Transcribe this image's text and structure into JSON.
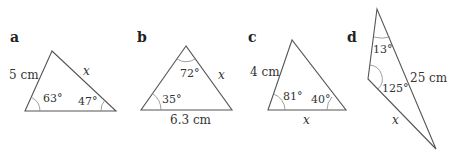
{
  "figure": {
    "panels": [
      {
        "id": "a",
        "side_labels": {
          "left": "5 cm",
          "right": "x"
        },
        "angles": {
          "bottom_left": "63°",
          "bottom_right": "47°"
        }
      },
      {
        "id": "b",
        "side_labels": {
          "right": "x",
          "bottom": "6.3 cm"
        },
        "angles": {
          "top": "72°",
          "bottom_left": "35°"
        }
      },
      {
        "id": "c",
        "side_labels": {
          "left": "4 cm",
          "bottom": "x"
        },
        "angles": {
          "bottom_left": "81°",
          "bottom_right": "40°"
        }
      },
      {
        "id": "d",
        "side_labels": {
          "right": "25 cm",
          "bottom": "x"
        },
        "angles": {
          "top": "13°",
          "left": "125°"
        }
      }
    ]
  }
}
